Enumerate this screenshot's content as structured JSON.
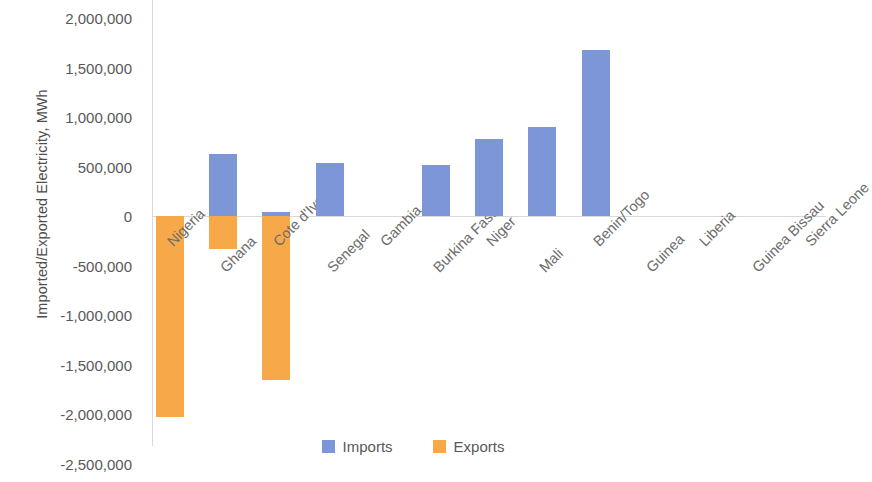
{
  "chart_data": {
    "type": "bar",
    "title": "",
    "xlabel": "",
    "ylabel": "Imported/Exported Electricity, MWh",
    "ylim": [
      -2500000,
      2000000
    ],
    "ytick_labels": [
      "2,000,000",
      "1,500,000",
      "1,000,000",
      "500,000",
      "0",
      "-500,000",
      "-1,000,000",
      "-1,500,000",
      "-2,000,000",
      "-2,500,000"
    ],
    "ytick_values": [
      2000000,
      1500000,
      1000000,
      500000,
      0,
      -500000,
      -1000000,
      -1500000,
      -2000000,
      -2500000
    ],
    "grid": false,
    "legend_position": "bottom",
    "categories": [
      "Nigeria",
      "Ghana",
      "Cote d'Ivoire",
      "Senegal",
      "Gambia",
      "Burkina Faso",
      "Niger",
      "Mali",
      "Benin/Togo",
      "Guinea",
      "Liberia",
      "Guinea Bissau",
      "Sierra Leone"
    ],
    "series": [
      {
        "name": "Imports",
        "color": "#7d96d8",
        "values": [
          0,
          626000,
          40000,
          535000,
          0,
          515000,
          780000,
          900000,
          1677000,
          0,
          0,
          0,
          0
        ]
      },
      {
        "name": "Exports",
        "color": "#f7a94a",
        "values": [
          -2030000,
          -333000,
          -1656000,
          0,
          0,
          0,
          0,
          0,
          0,
          0,
          0,
          0,
          0
        ]
      }
    ]
  },
  "legend": {
    "items": [
      {
        "label": "Imports",
        "color": "#7d96d8"
      },
      {
        "label": "Exports",
        "color": "#f7a94a"
      }
    ]
  }
}
